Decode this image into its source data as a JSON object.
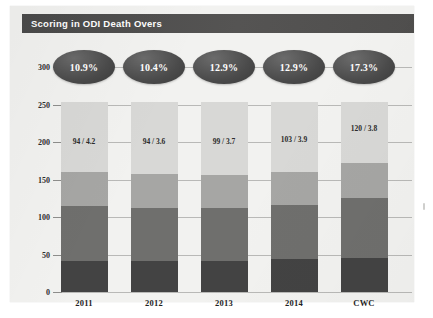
{
  "title": "Scoring in ODI Death Overs",
  "chart_data": {
    "type": "bar",
    "subtype": "stacked-bar-with-bubble-annotations",
    "title": "Scoring in ODI Death Overs",
    "xlabel": "",
    "ylabel": "",
    "ylim": [
      0,
      300
    ],
    "yticks": [
      0,
      50,
      100,
      150,
      200,
      250,
      300
    ],
    "grid": true,
    "legend": "none",
    "categories": [
      "2011",
      "2012",
      "2013",
      "2014",
      "CWC"
    ],
    "series": [
      {
        "name": "segment-1-bottom",
        "color": "#434343",
        "values": [
          42,
          42,
          42,
          44,
          46
        ]
      },
      {
        "name": "segment-2",
        "color": "#6f6f6d",
        "values": [
          73,
          70,
          70,
          72,
          79
        ]
      },
      {
        "name": "segment-3",
        "color": "#a6a6a4",
        "values": [
          45,
          45,
          44,
          44,
          47
        ]
      },
      {
        "name": "segment-4-top",
        "color": "#d8d8d6",
        "values": [
          93,
          96,
          97,
          93,
          81
        ]
      }
    ],
    "totals": [
      253,
      253,
      253,
      253,
      253
    ],
    "bar_labels": [
      "94 / 4.2",
      "94 / 3.6",
      "99 / 3.7",
      "103 / 3.9",
      "120 / 3.8"
    ],
    "bubble_labels": [
      "10.9%",
      "10.4%",
      "12.9%",
      "12.9%",
      "17.3%"
    ],
    "colors": {
      "title_bar": "#4b4b4b",
      "panel_background": "#f2f2f0",
      "bubble": "#4d4d4d",
      "gridline": "#b9b9b7"
    }
  },
  "bars": [
    {
      "category": "2011",
      "bubble": "10.9%",
      "label": "94 / 4.2",
      "segments": [
        42,
        73,
        45,
        93
      ],
      "boundaries": [
        0,
        42,
        115,
        160,
        253
      ],
      "label_value": 200
    },
    {
      "category": "2012",
      "bubble": "10.4%",
      "label": "94 / 3.6",
      "segments": [
        42,
        70,
        45,
        96
      ],
      "boundaries": [
        0,
        42,
        112,
        157,
        253
      ],
      "label_value": 200
    },
    {
      "category": "2013",
      "bubble": "12.9%",
      "label": "99 / 3.7",
      "segments": [
        42,
        70,
        44,
        97
      ],
      "boundaries": [
        0,
        42,
        112,
        156,
        253
      ],
      "label_value": 200
    },
    {
      "category": "2014",
      "bubble": "12.9%",
      "label": "103 / 3.9",
      "segments": [
        44,
        72,
        44,
        93
      ],
      "boundaries": [
        0,
        44,
        116,
        160,
        253
      ],
      "label_value": 203
    },
    {
      "category": "CWC",
      "bubble": "17.3%",
      "label": "120 / 3.8",
      "segments": [
        46,
        79,
        47,
        81
      ],
      "boundaries": [
        0,
        46,
        125,
        172,
        253
      ],
      "label_value": 218
    }
  ],
  "y_axis": {
    "ticks": [
      "300",
      "250",
      "200",
      "150",
      "100",
      "50",
      "0"
    ],
    "values": [
      300,
      250,
      200,
      150,
      100,
      50,
      0
    ]
  }
}
